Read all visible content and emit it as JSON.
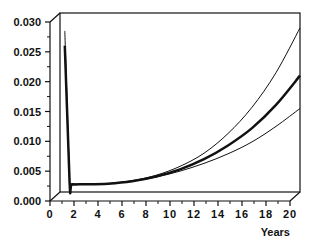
{
  "chart_data": {
    "type": "line",
    "title": "",
    "xlabel": "Years",
    "ylabel": "",
    "xlim": [
      0,
      20
    ],
    "ylim": [
      0,
      0.03
    ],
    "x_ticks": [
      "0",
      "2",
      "4",
      "6",
      "8",
      "10",
      "12",
      "14",
      "16",
      "18",
      "20"
    ],
    "y_ticks": [
      "0.000",
      "0.005",
      "0.010",
      "0.015",
      "0.020",
      "0.025",
      "0.030"
    ],
    "grid": false,
    "legend": null,
    "style": "3D box frame, black lines",
    "x": [
      0.4,
      0.8,
      1,
      2,
      4,
      6,
      8,
      10,
      12,
      14,
      16,
      18,
      20
    ],
    "series": [
      {
        "name": "upper",
        "stroke_width": 1,
        "values": [
          0.027,
          0.0018,
          0.0014,
          0.0013,
          0.0014,
          0.0019,
          0.0028,
          0.0043,
          0.0065,
          0.0098,
          0.0142,
          0.02,
          0.0275
        ]
      },
      {
        "name": "central",
        "stroke_width": 2.5,
        "values": [
          0.0245,
          0.0016,
          0.0013,
          0.0013,
          0.0014,
          0.0018,
          0.0026,
          0.0038,
          0.0055,
          0.0078,
          0.0107,
          0.0146,
          0.0195
        ]
      },
      {
        "name": "lower",
        "stroke_width": 1,
        "values": [
          0.0245,
          0.0015,
          0.0013,
          0.0013,
          0.0014,
          0.0018,
          0.0025,
          0.0035,
          0.0048,
          0.0064,
          0.0084,
          0.011,
          0.014
        ]
      }
    ]
  }
}
